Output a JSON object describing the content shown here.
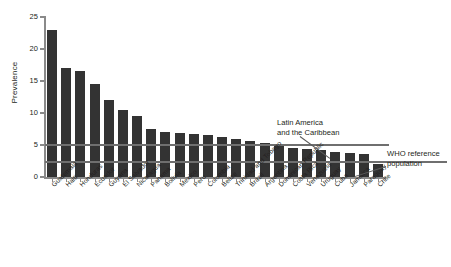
{
  "chart_data": {
    "type": "bar",
    "title": "",
    "xlabel": "",
    "ylabel": "Prevalence",
    "ylim": [
      0,
      25
    ],
    "yticks": [
      0,
      5,
      10,
      15,
      20,
      25
    ],
    "grid": false,
    "legend_position": "none",
    "bar_color": "#333333",
    "categories": [
      "Guatemala",
      "Haiti",
      "Honduras",
      "Ecuador",
      "Guyana",
      "El Salvador",
      "Nicaragua",
      "Panama",
      "Bolivia",
      "Mexico",
      "Peru",
      "Colombia",
      "Belize",
      "Trinidad and Tobago",
      "Brazil",
      "Argentina",
      "Dominican Republic",
      "Costa Rica",
      "Venezuela",
      "Uruguay",
      "Cuba",
      "Jamaica",
      "Paraguay",
      "Chile"
    ],
    "values": [
      23.0,
      17.0,
      16.5,
      14.5,
      12.0,
      10.5,
      9.5,
      7.5,
      7.0,
      6.8,
      6.7,
      6.5,
      6.3,
      6.0,
      5.6,
      5.3,
      4.8,
      4.6,
      4.4,
      4.2,
      3.9,
      3.8,
      3.6,
      2.0
    ],
    "reference_lines": [
      {
        "id": "lac",
        "label": "Latin America and the Caribbean",
        "value": 5.0,
        "color": "#6f6f6f"
      },
      {
        "id": "who",
        "label": "WHO reference population",
        "value": 2.3,
        "color": "#6f6f6f"
      }
    ],
    "annotations": [
      {
        "id": "lac",
        "line1": "Latin America",
        "line2": "and the Caribbean"
      },
      {
        "id": "who",
        "line1": "WHO reference",
        "line2": "population"
      }
    ]
  }
}
